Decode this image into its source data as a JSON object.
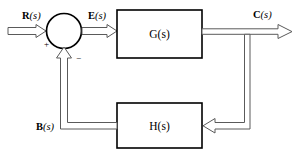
{
  "diagram": {
    "type": "control-system-block-diagram",
    "background_color": "#ffffff",
    "line_color": "#5a5a5a",
    "block_border_color": "#000000",
    "text_color": "#000000",
    "signals": {
      "input": {
        "bold": "R",
        "italic": "(s)",
        "full": "R(s)"
      },
      "error": {
        "bold": "E",
        "italic": "(s)",
        "full": "E(s)"
      },
      "output": {
        "bold": "C",
        "italic": "(s)",
        "full": "C(s)"
      },
      "feedback": {
        "bold": "B",
        "italic": "(s)",
        "full": "B(s)"
      }
    },
    "blocks": {
      "forward": {
        "bold": "G",
        "italic": "(s)",
        "full": "G(s)"
      },
      "feedback": {
        "bold": "H",
        "italic": "(s)",
        "full": "H(s)"
      }
    },
    "summing_junction": {
      "positive_sign": "+",
      "negative_sign": "−"
    }
  }
}
